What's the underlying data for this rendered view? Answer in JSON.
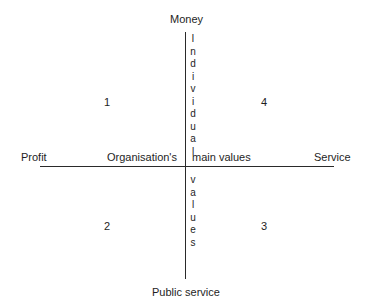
{
  "axes": {
    "top": "Money",
    "bottom": "Public service",
    "left": "Profit",
    "right": "Service"
  },
  "center_labels": {
    "left": "Organisation's",
    "right": "main values"
  },
  "vertical_words": {
    "upper": [
      "I",
      "n",
      "d",
      "i",
      "v",
      "i",
      "d",
      "u",
      "a",
      "l"
    ],
    "lower": [
      "v",
      "a",
      "l",
      "u",
      "e",
      "s"
    ]
  },
  "quadrants": {
    "q1": "1",
    "q2": "2",
    "q3": "3",
    "q4": "4"
  }
}
